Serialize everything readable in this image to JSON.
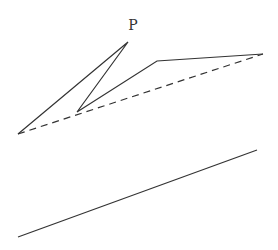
{
  "diagram": {
    "label_p": {
      "text": "P",
      "x": 133,
      "y": 30
    },
    "stroke_color": "#333333",
    "solid_polyline": [
      [
        18,
        134
      ],
      [
        128,
        42
      ],
      [
        77,
        112
      ],
      [
        157,
        61
      ],
      [
        263,
        54
      ]
    ],
    "dashed_line": {
      "x1": 18,
      "y1": 134,
      "x2": 263,
      "y2": 54
    },
    "bottom_line": {
      "x1": 18,
      "y1": 237,
      "x2": 257,
      "y2": 150
    }
  }
}
